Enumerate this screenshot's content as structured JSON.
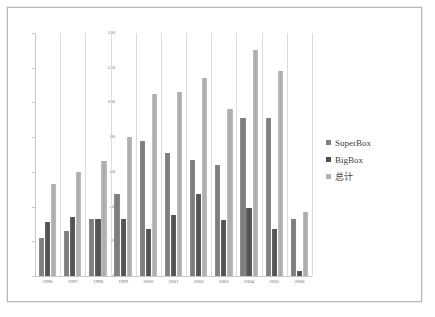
{
  "chart_data": {
    "type": "bar",
    "title": "",
    "subtitle": "",
    "xlabel": "",
    "ylabel": "",
    "ylim": [
      0,
      140
    ],
    "yticks": [
      0,
      20,
      40,
      60,
      80,
      100,
      120,
      140
    ],
    "grid": "vertical",
    "legend_position": "right",
    "categories": [
      "1996",
      "1997",
      "1998",
      "1999",
      "2000",
      "2001",
      "2002",
      "2003",
      "2004",
      "2005",
      "2006"
    ],
    "series": [
      {
        "name": "SuperBox",
        "color": "#7f7f7f",
        "values": [
          22,
          26,
          33,
          47,
          78,
          71,
          67,
          64,
          91,
          91,
          33
        ]
      },
      {
        "name": "BigBox",
        "color": "#4f4f4f",
        "values": [
          31,
          34,
          33,
          33,
          27,
          35,
          47,
          32,
          39,
          27,
          3
        ]
      },
      {
        "name": "总计",
        "color": "#b4b4b4",
        "values": [
          53,
          60,
          66,
          80,
          105,
          106,
          114,
          96,
          130,
          118,
          37
        ]
      }
    ]
  },
  "legend": {
    "items": [
      {
        "label": "SuperBox"
      },
      {
        "label": "BigBox"
      },
      {
        "label": "总计"
      }
    ]
  },
  "axis": {
    "y_tick_labels": [
      "140",
      "120",
      "100",
      "80",
      "60",
      "40",
      "20",
      "0"
    ]
  }
}
